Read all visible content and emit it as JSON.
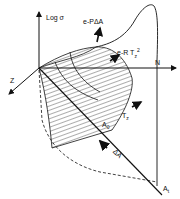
{
  "diagram": {
    "axis_labels": {
      "vertical": "Log σ",
      "horizontal": "N",
      "depth": "Z"
    },
    "annotations": {
      "pressure_term": "e-PΔA",
      "temperature_term_base": "e-R T",
      "temperature_term_sub": "z",
      "temperature_term_sup": "2",
      "tz_label": "T",
      "tz_sub": "z",
      "a0_label": "A",
      "a0_sub": "0",
      "delta_a_label": "ΔA",
      "at_label": "A",
      "at_sub": "t"
    },
    "colors": {
      "line": "#111111",
      "background": "#ffffff"
    }
  }
}
